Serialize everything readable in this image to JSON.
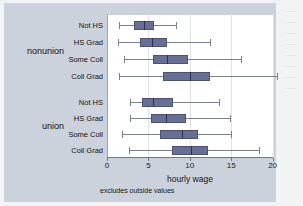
{
  "chart_data": {
    "type": "box",
    "title": "",
    "xlabel": "hourly wage",
    "ylabel": "",
    "note": "excludes outside values",
    "xlim": [
      0,
      22
    ],
    "xticks": [
      0,
      5,
      10,
      15,
      20
    ],
    "xtick_labels": [
      "0",
      "5",
      "10",
      "15",
      "20"
    ],
    "grid": true,
    "grid_axis": "x",
    "orientation": "horizontal",
    "group_labels": [
      "nonunion",
      "union"
    ],
    "category_labels": [
      "Not HS",
      "HS Grad",
      "Some Coll",
      "Coll Grad"
    ],
    "box_color": "#666f96",
    "line_color": "#7a8090",
    "boxes": [
      {
        "group": "nonunion",
        "category": "Not HS",
        "lower_whisker": 1.5,
        "q1": 3.3,
        "median": 4.5,
        "q3": 5.7,
        "upper_whisker": 8.3
      },
      {
        "group": "nonunion",
        "category": "HS Grad",
        "lower_whisker": 1.3,
        "q1": 4.0,
        "median": 5.4,
        "q3": 7.2,
        "upper_whisker": 12.4
      },
      {
        "group": "nonunion",
        "category": "Some Coll",
        "lower_whisker": 2.0,
        "q1": 5.5,
        "median": 7.3,
        "q3": 9.8,
        "upper_whisker": 16.2
      },
      {
        "group": "nonunion",
        "category": "Coll Grad",
        "lower_whisker": 1.5,
        "q1": 6.8,
        "median": 10.0,
        "q3": 12.4,
        "upper_whisker": 20.5
      },
      {
        "group": "union",
        "category": "Not HS",
        "lower_whisker": 2.8,
        "q1": 4.2,
        "median": 5.6,
        "q3": 8.0,
        "upper_whisker": 13.5
      },
      {
        "group": "union",
        "category": "HS Grad",
        "lower_whisker": 2.8,
        "q1": 5.3,
        "median": 7.1,
        "q3": 9.6,
        "upper_whisker": 14.8
      },
      {
        "group": "union",
        "category": "Some Coll",
        "lower_whisker": 1.8,
        "q1": 6.4,
        "median": 9.0,
        "q3": 11.0,
        "upper_whisker": 15.0
      },
      {
        "group": "union",
        "category": "Coll Grad",
        "lower_whisker": 2.6,
        "q1": 7.9,
        "median": 10.1,
        "q3": 12.2,
        "upper_whisker": 18.4
      }
    ]
  }
}
